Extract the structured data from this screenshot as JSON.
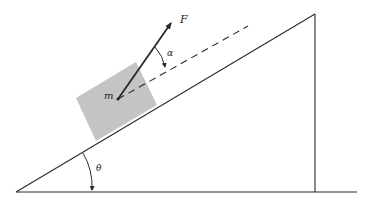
{
  "diagram": {
    "type": "inclined-plane-free-body",
    "colors": {
      "line": "#2a2a2a",
      "block": "#c4c4c4",
      "background": "#ffffff"
    },
    "labels": {
      "force": "F",
      "mass": "m",
      "force_angle": "α",
      "incline_angle": "θ"
    },
    "geometry": {
      "incline_base_left": [
        16,
        192
      ],
      "incline_top": [
        315,
        14
      ],
      "vertical_base": [
        315,
        192
      ],
      "ground_end": [
        357,
        192
      ],
      "block_corners": [
        [
          76,
          98
        ],
        [
          136,
          62
        ],
        [
          157,
          104
        ],
        [
          95,
          141
        ]
      ],
      "force_origin": [
        118,
        99
      ],
      "force_tip": [
        172,
        22
      ],
      "dashed_end": [
        248,
        26
      ]
    }
  }
}
